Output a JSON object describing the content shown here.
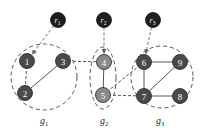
{
  "diagram": {
    "type": "graph-clusters",
    "roots": [
      {
        "id": "r1",
        "base": "r",
        "sub": "1",
        "x": 58,
        "y": 20,
        "target": "1"
      },
      {
        "id": "r2",
        "base": "r",
        "sub": "2",
        "x": 104,
        "y": 20,
        "target": "4"
      },
      {
        "id": "r3",
        "base": "r",
        "sub": "3",
        "x": 153,
        "y": 20,
        "target": "6"
      }
    ],
    "nodes": [
      {
        "id": "1",
        "label": "1",
        "x": 27,
        "y": 61,
        "fill": "#4a4a4a"
      },
      {
        "id": "2",
        "label": "2",
        "x": 25,
        "y": 93,
        "fill": "#4a4a4a"
      },
      {
        "id": "3",
        "label": "3",
        "x": 63,
        "y": 61,
        "fill": "#4a4a4a"
      },
      {
        "id": "4",
        "label": "4",
        "x": 104,
        "y": 62,
        "fill": "#8a8a8a"
      },
      {
        "id": "5",
        "label": "5",
        "x": 103,
        "y": 95,
        "fill": "#8a8a8a"
      },
      {
        "id": "6",
        "label": "6",
        "x": 144,
        "y": 62,
        "fill": "#4a4a4a"
      },
      {
        "id": "7",
        "label": "7",
        "x": 144,
        "y": 96,
        "fill": "#4a4a4a"
      },
      {
        "id": "8",
        "label": "8",
        "x": 180,
        "y": 96,
        "fill": "#4a4a4a"
      },
      {
        "id": "9",
        "label": "9",
        "x": 180,
        "y": 62,
        "fill": "#4a4a4a"
      }
    ],
    "edges": [
      {
        "from": "1",
        "to": "2",
        "style": "dashed"
      },
      {
        "from": "2",
        "to": "3",
        "style": "solid"
      },
      {
        "from": "3",
        "to": "4",
        "style": "dashed"
      },
      {
        "from": "4",
        "to": "5",
        "style": "solid"
      },
      {
        "from": "5",
        "to": "6",
        "style": "dashed"
      },
      {
        "from": "5",
        "to": "7",
        "style": "dashed"
      },
      {
        "from": "6",
        "to": "7",
        "style": "solid"
      },
      {
        "from": "6",
        "to": "9",
        "style": "solid"
      },
      {
        "from": "7",
        "to": "9",
        "style": "solid"
      },
      {
        "from": "7",
        "to": "8",
        "style": "solid"
      }
    ],
    "groups": [
      {
        "id": "g1",
        "base": "g",
        "sub": "1",
        "cx": 44,
        "cy": 77,
        "rx": 33,
        "ry": 33,
        "label_x": 44,
        "label_y": 124
      },
      {
        "id": "g2",
        "base": "g",
        "sub": "2",
        "cx": 103,
        "cy": 78,
        "rx": 13,
        "ry": 31,
        "label_x": 104,
        "label_y": 124
      },
      {
        "id": "g3",
        "base": "g",
        "sub": "3",
        "cx": 162,
        "cy": 77,
        "rx": 31,
        "ry": 31,
        "label_x": 160,
        "label_y": 124
      }
    ],
    "colors": {
      "root_fill": "#1e1e1e",
      "edge": "#555555",
      "dashed": "#555555"
    }
  }
}
